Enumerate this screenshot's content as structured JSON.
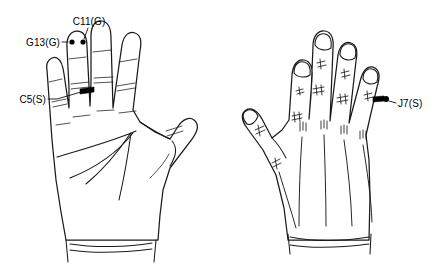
{
  "figure": {
    "background_color": "#ffffff",
    "line_color": "#1a1a1a",
    "marker_color": "#000000",
    "width": 441,
    "height": 271
  },
  "hands": {
    "left": {
      "name": "left-hand-palmar",
      "view": "palmar",
      "finger_count": 5
    },
    "right": {
      "name": "right-hand-dorsal",
      "view": "dorsal",
      "finger_count": 5
    }
  },
  "annotations": [
    {
      "id": "g13",
      "label": "G13(G)",
      "hand": "left",
      "marker": "dot",
      "location": "index-fingertip-left"
    },
    {
      "id": "c11",
      "label": "C11(G)",
      "hand": "left",
      "marker": "dot",
      "location": "index-fingertip-right"
    },
    {
      "id": "c5",
      "label": "C5(S)",
      "hand": "left",
      "marker": "bar",
      "location": "index-finger-middle-phalanx"
    },
    {
      "id": "j7",
      "label": "J7(S)",
      "hand": "right",
      "marker": "dot",
      "location": "little-finger-proximal-phalanx"
    }
  ]
}
